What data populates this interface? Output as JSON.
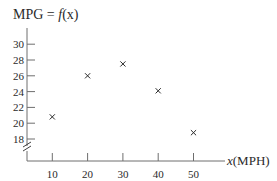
{
  "chart_data": {
    "type": "scatter",
    "title": "MPG = f(x)",
    "title_parts": {
      "lhs": "MPG = ",
      "fn": "f",
      "arg": "(x)"
    },
    "xlabel": "x(MPH)",
    "xlabel_parts": {
      "var": "x",
      "unit": "(MPH)"
    },
    "ylabel": "MPG",
    "x_ticks": [
      10,
      20,
      30,
      40,
      50
    ],
    "y_ticks": [
      18,
      20,
      22,
      24,
      26,
      28,
      30
    ],
    "y_axis_break": true,
    "xlim": [
      0,
      55
    ],
    "ylim": [
      16,
      31
    ],
    "grid": false,
    "legend": null,
    "marker": "x",
    "points": [
      {
        "x": 10,
        "y": 20.8
      },
      {
        "x": 20,
        "y": 26.0
      },
      {
        "x": 30,
        "y": 27.5
      },
      {
        "x": 40,
        "y": 24.1
      },
      {
        "x": 50,
        "y": 18.8
      }
    ]
  },
  "colors": {
    "ink": "#2a2a2a",
    "axis": "#6e6e6e",
    "background": "#ffffff"
  }
}
